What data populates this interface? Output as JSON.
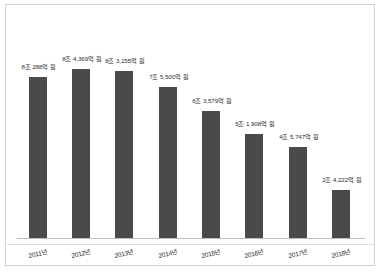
{
  "chart_data": {
    "type": "bar",
    "title": "",
    "subtitle": "",
    "xlabel": "",
    "ylabel": "",
    "grid": false,
    "legend": false,
    "orientation": "vertical",
    "unit": "억 원",
    "categories": [
      "2011년",
      "2012년",
      "2013년",
      "2014년",
      "2015년",
      "2016년",
      "2017년",
      "2018년"
    ],
    "values": [
      80288,
      84369,
      83155,
      75500,
      63579,
      51908,
      45747,
      24222
    ],
    "data_labels": [
      "8조 288억 원",
      "8조 4,369억 원",
      "8조 3,155억 원",
      "7조 5,500억 원",
      "6조 3,579억 원",
      "5조 1,908억 원",
      "4조 5,747억 원",
      "2조 4,222억 원"
    ],
    "ylim": [
      0,
      100000
    ],
    "series": [
      {
        "name": "금액",
        "values": [
          80288,
          84369,
          83155,
          75500,
          63579,
          51908,
          45747,
          24222
        ]
      }
    ]
  },
  "style": {
    "bar_color": "#4a4a4a",
    "frame_color": "#d2d2d2",
    "axis_color": "#bdbdbd",
    "background": "#ffffff",
    "label_color": "#2b2b2b"
  }
}
